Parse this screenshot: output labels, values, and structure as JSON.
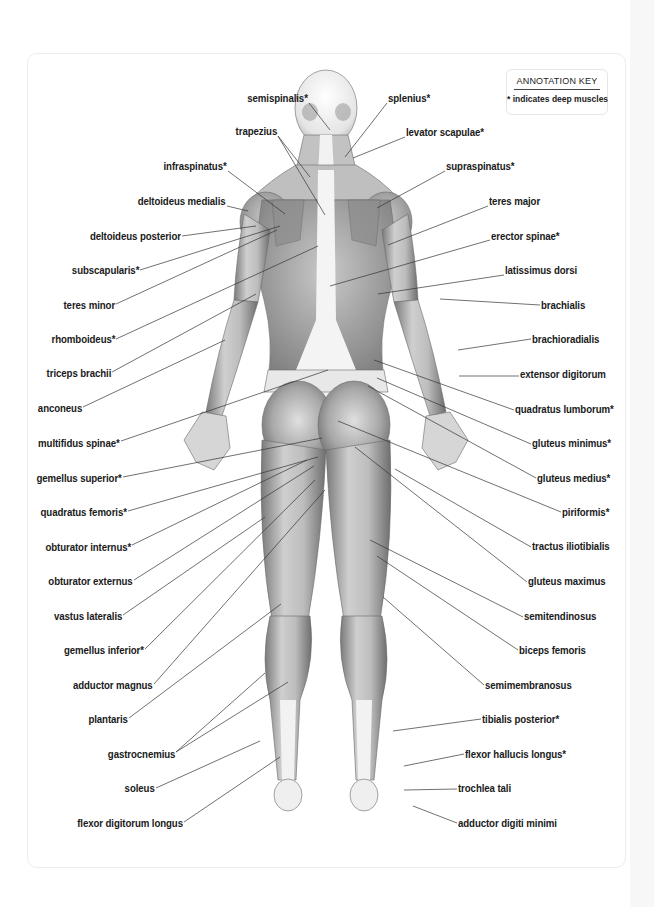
{
  "diagram": {
    "annotation_key": {
      "title": "ANNOTATION KEY",
      "text": "* indicates deep muscles"
    },
    "colors": {
      "label_text": "#1a1a1a",
      "leader_line": "#333333",
      "muscle_dark": "#6e6e6e",
      "muscle_mid": "#a9a9a9",
      "muscle_light": "#dedede",
      "tendon": "#f4f4f4",
      "card_border": "#ececec"
    },
    "labels_left": [
      {
        "text": "semispinalis*",
        "x": 308,
        "y": 98,
        "line": [
          [
            309,
            103
          ],
          [
            330,
            130
          ]
        ]
      },
      {
        "text": "trapezius",
        "x": 277,
        "y": 131,
        "line": [
          [
            278,
            136
          ],
          [
            310,
            177
          ],
          [
            278,
            136
          ],
          [
            325,
            215
          ]
        ]
      },
      {
        "text": "infraspinatus*",
        "x": 227,
        "y": 166,
        "line": [
          [
            228,
            171
          ],
          [
            285,
            214
          ]
        ]
      },
      {
        "text": "deltoideus medialis",
        "x": 226,
        "y": 201,
        "line": [
          [
            227,
            206
          ],
          [
            248,
            211
          ]
        ]
      },
      {
        "text": "deltoideus posterior",
        "x": 181,
        "y": 236,
        "line": [
          [
            182,
            236
          ],
          [
            256,
            226
          ]
        ]
      },
      {
        "text": "subscapularis*",
        "x": 139,
        "y": 270,
        "line": [
          [
            140,
            270
          ],
          [
            280,
            226
          ]
        ]
      },
      {
        "text": "teres minor",
        "x": 115,
        "y": 305,
        "line": [
          [
            116,
            304
          ],
          [
            277,
            230
          ]
        ]
      },
      {
        "text": "rhomboideus*",
        "x": 115,
        "y": 339,
        "line": [
          [
            116,
            339
          ],
          [
            318,
            246
          ]
        ]
      },
      {
        "text": "triceps brachii",
        "x": 111,
        "y": 373,
        "line": [
          [
            112,
            372
          ],
          [
            256,
            294
          ]
        ]
      },
      {
        "text": "anconeus",
        "x": 82,
        "y": 408,
        "line": [
          [
            83,
            407
          ],
          [
            225,
            340
          ]
        ]
      },
      {
        "text": "multifidus spinae*",
        "x": 120,
        "y": 443,
        "line": [
          [
            121,
            441
          ],
          [
            328,
            370
          ]
        ]
      },
      {
        "text": "gemellus superior*",
        "x": 122,
        "y": 478,
        "line": [
          [
            123,
            477
          ],
          [
            322,
            438
          ]
        ]
      },
      {
        "text": "quadratus femoris*",
        "x": 127,
        "y": 512,
        "line": [
          [
            128,
            511
          ],
          [
            318,
            457
          ]
        ]
      },
      {
        "text": "obturator internus*",
        "x": 131,
        "y": 547,
        "line": [
          [
            132,
            545
          ],
          [
            307,
            460
          ]
        ]
      },
      {
        "text": "obturator externus",
        "x": 133,
        "y": 581,
        "line": [
          [
            134,
            580
          ],
          [
            314,
            466
          ]
        ]
      },
      {
        "text": "vastus lateralis",
        "x": 122,
        "y": 616,
        "line": [
          [
            123,
            615
          ],
          [
            265,
            517
          ]
        ]
      },
      {
        "text": "gemellus inferior*",
        "x": 144,
        "y": 650,
        "line": [
          [
            145,
            649
          ],
          [
            315,
            480
          ]
        ]
      },
      {
        "text": "adductor magnus",
        "x": 153,
        "y": 685,
        "line": [
          [
            154,
            684
          ],
          [
            325,
            490
          ]
        ]
      },
      {
        "text": "plantaris",
        "x": 128,
        "y": 719,
        "line": [
          [
            129,
            718
          ],
          [
            281,
            604
          ]
        ]
      },
      {
        "text": "gastrocnemius",
        "x": 175,
        "y": 754,
        "line": [
          [
            176,
            752
          ],
          [
            265,
            673
          ],
          [
            176,
            752
          ],
          [
            288,
            682
          ]
        ]
      },
      {
        "text": "soleus",
        "x": 155,
        "y": 788,
        "line": [
          [
            156,
            788
          ],
          [
            260,
            741
          ]
        ]
      },
      {
        "text": "flexor digitorum longus",
        "x": 183,
        "y": 823,
        "line": [
          [
            184,
            822
          ],
          [
            280,
            757
          ]
        ]
      }
    ],
    "labels_right": [
      {
        "text": "splenius*",
        "x": 388,
        "y": 98,
        "line": [
          [
            387,
            103
          ],
          [
            345,
            157
          ]
        ]
      },
      {
        "text": "levator scapulae*",
        "x": 406,
        "y": 132,
        "line": [
          [
            405,
            137
          ],
          [
            353,
            158
          ]
        ]
      },
      {
        "text": "supraspinatus*",
        "x": 446,
        "y": 166,
        "line": [
          [
            445,
            171
          ],
          [
            377,
            208
          ]
        ]
      },
      {
        "text": "teres major",
        "x": 489,
        "y": 201,
        "line": [
          [
            488,
            206
          ],
          [
            388,
            245
          ]
        ]
      },
      {
        "text": "erector spinae*",
        "x": 491,
        "y": 236,
        "line": [
          [
            490,
            240
          ],
          [
            330,
            286
          ]
        ]
      },
      {
        "text": "latissimus dorsi",
        "x": 505,
        "y": 270,
        "line": [
          [
            504,
            275
          ],
          [
            378,
            294
          ]
        ]
      },
      {
        "text": "brachialis",
        "x": 541,
        "y": 305,
        "line": [
          [
            540,
            305
          ],
          [
            440,
            299
          ]
        ]
      },
      {
        "text": "brachioradialis",
        "x": 532,
        "y": 339,
        "line": [
          [
            531,
            339
          ],
          [
            458,
            350
          ]
        ]
      },
      {
        "text": "extensor digitorum",
        "x": 520,
        "y": 374,
        "line": [
          [
            519,
            376
          ],
          [
            459,
            376
          ]
        ]
      },
      {
        "text": "quadratus lumborum*",
        "x": 515,
        "y": 409,
        "line": [
          [
            514,
            410
          ],
          [
            374,
            360
          ]
        ]
      },
      {
        "text": "gluteus minimus*",
        "x": 532,
        "y": 443,
        "line": [
          [
            531,
            444
          ],
          [
            377,
            378
          ]
        ]
      },
      {
        "text": "gluteus medius*",
        "x": 537,
        "y": 478,
        "line": [
          [
            536,
            478
          ],
          [
            368,
            386
          ]
        ]
      },
      {
        "text": "piriformis*",
        "x": 562,
        "y": 512,
        "line": [
          [
            561,
            512
          ],
          [
            338,
            421
          ]
        ]
      },
      {
        "text": "tractus iliotibialis",
        "x": 532,
        "y": 546,
        "line": [
          [
            531,
            547
          ],
          [
            395,
            469
          ]
        ]
      },
      {
        "text": "gluteus maximus",
        "x": 528,
        "y": 581,
        "line": [
          [
            527,
            582
          ],
          [
            355,
            447
          ]
        ]
      },
      {
        "text": "semitendinosus",
        "x": 524,
        "y": 616,
        "line": [
          [
            523,
            617
          ],
          [
            370,
            540
          ]
        ]
      },
      {
        "text": "biceps femoris",
        "x": 519,
        "y": 650,
        "line": [
          [
            518,
            650
          ],
          [
            377,
            556
          ]
        ]
      },
      {
        "text": "semimembranosus",
        "x": 485,
        "y": 685,
        "line": [
          [
            484,
            685
          ],
          [
            383,
            597
          ]
        ]
      },
      {
        "text": "tibialis posterior*",
        "x": 482,
        "y": 719,
        "line": [
          [
            481,
            719
          ],
          [
            393,
            731
          ]
        ]
      },
      {
        "text": "flexor hallucis longus*",
        "x": 465,
        "y": 754,
        "line": [
          [
            464,
            754
          ],
          [
            404,
            766
          ]
        ]
      },
      {
        "text": "trochlea tali",
        "x": 458,
        "y": 788,
        "line": [
          [
            457,
            789
          ],
          [
            404,
            790
          ]
        ]
      },
      {
        "text": "adductor digiti minimi",
        "x": 458,
        "y": 823,
        "line": [
          [
            457,
            823
          ],
          [
            413,
            806
          ]
        ]
      }
    ]
  }
}
